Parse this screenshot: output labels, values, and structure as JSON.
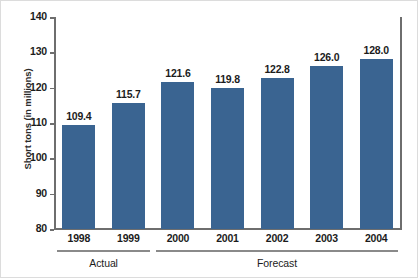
{
  "chart_data": {
    "type": "bar",
    "title": "",
    "xlabel": "",
    "ylabel": "Short tons (in millions)",
    "categories": [
      "1998",
      "1999",
      "2000",
      "2001",
      "2002",
      "2003",
      "2004"
    ],
    "values": [
      109.4,
      115.7,
      121.6,
      119.8,
      122.8,
      126.0,
      128.0
    ],
    "value_labels": [
      "109.4",
      "115.7",
      "121.6",
      "119.8",
      "122.8",
      "126.0",
      "128.0"
    ],
    "ylim": [
      80,
      140
    ],
    "yticks": [
      80,
      90,
      100,
      110,
      120,
      130,
      140
    ],
    "ytick_labels": [
      "80",
      "90",
      "100",
      "110",
      "120",
      "130",
      "140"
    ],
    "grid": false,
    "legend": "none",
    "bar_color": "#3a6491",
    "axis_color": "#6e6e6e",
    "groups": [
      {
        "label": "Actual",
        "categories": [
          "1998",
          "1999"
        ]
      },
      {
        "label": "Forecast",
        "categories": [
          "2000",
          "2001",
          "2002",
          "2003",
          "2004"
        ]
      }
    ]
  }
}
